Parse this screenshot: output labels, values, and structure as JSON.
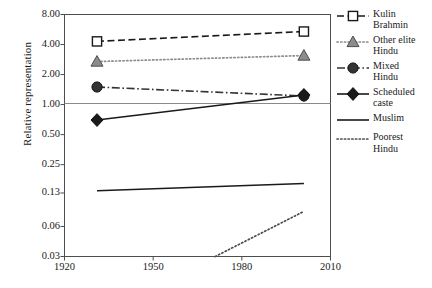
{
  "chart_data": {
    "type": "line",
    "title": "",
    "xlabel": "",
    "ylabel": "Relative representation",
    "x_ticks": [
      1920,
      1950,
      1980,
      2010
    ],
    "x_tick_labels": [
      "1920",
      "1950",
      "1980",
      "2010"
    ],
    "xlim": [
      1920,
      2010
    ],
    "y_ticks": [
      8.0,
      4.0,
      2.0,
      1.0,
      0.5,
      0.25,
      0.13,
      0.06,
      0.03
    ],
    "y_tick_labels": [
      "8.00",
      "4.00",
      "2.00",
      "1.00",
      "0.50",
      "0.25",
      "0.13",
      "0.06",
      "0.03"
    ],
    "ylim": [
      0.03,
      8.0
    ],
    "yscale": "log",
    "grid": false,
    "reference_line": 1.0,
    "legend_position": "right",
    "series": [
      {
        "name": "Kulin Brahmin",
        "label_lines": [
          "Kulin",
          "Brahmin"
        ],
        "marker": "open-square",
        "linestyle": "dashed",
        "color": "#1a1a1a",
        "x": [
          1931,
          2001
        ],
        "y": [
          4.3,
          5.4
        ]
      },
      {
        "name": "Other elite Hindu",
        "label_lines": [
          "Other elite",
          "Hindu"
        ],
        "marker": "filled-triangle",
        "linestyle": "dotted",
        "color": "#8c8c8c",
        "x": [
          1931,
          2001
        ],
        "y": [
          2.7,
          3.1
        ]
      },
      {
        "name": "Mixed Hindu",
        "label_lines": [
          "Mixed",
          "Hindu"
        ],
        "marker": "filled-circle",
        "linestyle": "dash-dot",
        "color": "#333333",
        "x": [
          1931,
          2001
        ],
        "y": [
          1.5,
          1.22
        ]
      },
      {
        "name": "Scheduled caste",
        "label_lines": [
          "Scheduled",
          "caste"
        ],
        "marker": "filled-diamond",
        "linestyle": "solid",
        "color": "#1a1a1a",
        "x": [
          1931,
          2001
        ],
        "y": [
          0.7,
          1.25
        ]
      },
      {
        "name": "Muslim",
        "label_lines": [
          "Muslim"
        ],
        "marker": "none",
        "linestyle": "solid",
        "color": "#1a1a1a",
        "x": [
          1931,
          2001
        ],
        "y": [
          0.137,
          0.162
        ]
      },
      {
        "name": "Poorest Hindu",
        "label_lines": [
          "Poorest",
          "Hindu"
        ],
        "marker": "none",
        "linestyle": "dotted",
        "color": "#4d4d4d",
        "x": [
          1971,
          2001
        ],
        "y": [
          0.03,
          0.085
        ]
      }
    ]
  },
  "caption": ""
}
